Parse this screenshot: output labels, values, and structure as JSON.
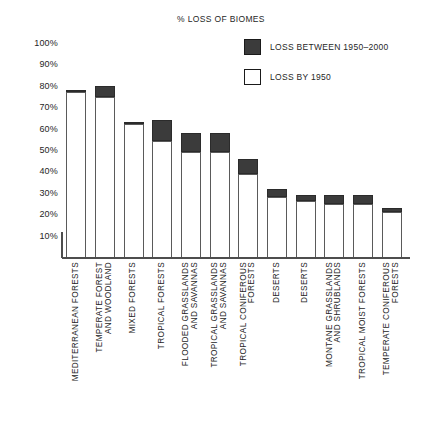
{
  "title": "% LOSS OF BIOMES",
  "legend": [
    {
      "label": "LOSS BETWEEN 1950–2000",
      "swatch": "#3b3b3b",
      "key": "post"
    },
    {
      "label": "LOSS BY 1950",
      "swatch": "#ffffff",
      "key": "pre"
    }
  ],
  "yticks": [
    "100%",
    "90%",
    "80%",
    "70%",
    "60%",
    "50%",
    "40%",
    "30%",
    "20%",
    "10%"
  ],
  "colors": {
    "loss_1950_2000": "#3b3b3b",
    "loss_by_1950": "#ffffff",
    "axis": "#4d4d4d",
    "outline": "#5a5a5a",
    "text": "#262626"
  },
  "chart_data": {
    "type": "bar",
    "subtype": "stacked",
    "title": "% LOSS OF BIOMES",
    "xlabel": "",
    "ylabel": "",
    "ylim": [
      0,
      100
    ],
    "yunit": "%",
    "ytick_values": [
      10,
      20,
      30,
      40,
      50,
      60,
      70,
      80,
      90,
      100
    ],
    "grid": false,
    "legend_position": "top-right",
    "categories": [
      "MEDITERRANEAN FORESTS",
      "TEMPERATE FOREST AND WOODLAND",
      "MIXED FORESTS",
      "TROPICAL FORESTS",
      "FLOODED GRASSLANDS AND SAVANNAS",
      "TROPICAL GRASSLANDS AND SAVANNAS",
      "TROPICAL CONIFEROUS FORESTS",
      "DESERTS",
      "DESERTS",
      "MONTANE GRASSLANDS AND SHRUBLANDS",
      "TROPICAL MOIST FORESTS",
      "TEMPERATE CONIFEROUS FORESTS"
    ],
    "category_lines": [
      [
        "MEDITERRANEAN FORESTS"
      ],
      [
        "TEMPERATE FOREST",
        "AND WOODLAND"
      ],
      [
        "MIXED FORESTS"
      ],
      [
        "TROPICAL FORESTS"
      ],
      [
        "FLOODED GRASSLANDS",
        "AND SAVANNAS"
      ],
      [
        "TROPICAL GRASSLANDS",
        "AND SAVANNAS"
      ],
      [
        "TROPICAL CONIFEROUS",
        "FORESTS"
      ],
      [
        "DESERTS"
      ],
      [
        "DESERTS"
      ],
      [
        "MONTANE GRASSLANDS",
        "AND SHRUBLANDS"
      ],
      [
        "TROPICAL MOIST FORESTS"
      ],
      [
        "TEMPERATE CONIFEROUS",
        "FORESTS"
      ]
    ],
    "series": [
      {
        "name": "LOSS BY 1950",
        "color": "#ffffff",
        "values": [
          77,
          75,
          62,
          54,
          49,
          49,
          39,
          28,
          26,
          25,
          25,
          21
        ]
      },
      {
        "name": "LOSS BETWEEN 1950–2000",
        "color": "#3b3b3b",
        "values": [
          1,
          5,
          1,
          10,
          9,
          9,
          7,
          4,
          3,
          4,
          4,
          2
        ]
      }
    ],
    "totals": [
      78,
      80,
      63,
      64,
      58,
      58,
      46,
      32,
      29,
      29,
      29,
      23
    ]
  }
}
